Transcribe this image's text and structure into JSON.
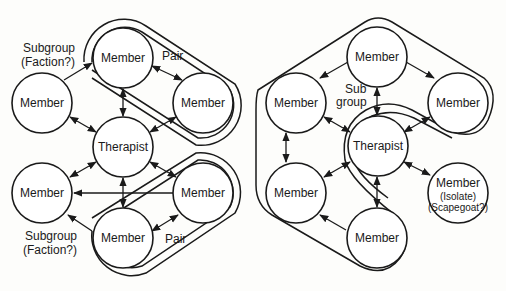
{
  "left_diagram": {
    "nodes": {
      "top": "Member",
      "left": "Member",
      "right": "Member",
      "center": "Therapist",
      "lower_left": "Member",
      "lower_right": "Member",
      "bottom": "Member"
    },
    "annotations": {
      "subgroup_top_line1": "Subgroup",
      "subgroup_top_line2": "(Faction?)",
      "pair_top": "Pair",
      "subgroup_bottom_line1": "Subgroup",
      "subgroup_bottom_line2": "(Faction?)",
      "pair_bottom": "Pair"
    }
  },
  "right_diagram": {
    "nodes": {
      "top": "Member",
      "left": "Member",
      "right": "Member",
      "center": "Therapist",
      "lower_left": "Member",
      "isolate": "Member",
      "isolate_sub1": "(Isolate)",
      "isolate_sub2": "(Scapegoat?)",
      "bottom": "Member"
    },
    "annotations": {
      "subgroup_line1": "Sub",
      "subgroup_line2": "group"
    }
  },
  "colors": {
    "stroke": "#1a1a1a",
    "background": "#fdfdfb",
    "node_fill": "#ffffff"
  }
}
